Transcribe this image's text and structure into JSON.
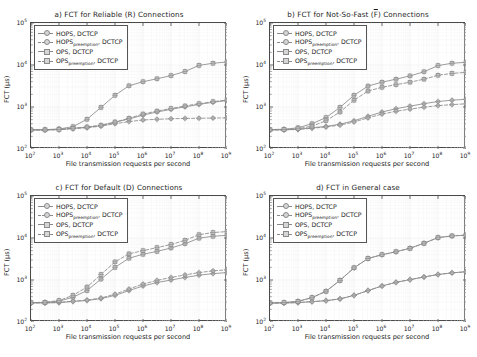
{
  "figure": {
    "background": "#ffffff",
    "line_color": "#8a8a8a",
    "marker_face": "#d6d6d6",
    "axis_color": "#4a4a4a",
    "rows": 2,
    "cols": 2
  },
  "axis": {
    "xlabel": "File transmission requests per second",
    "ylabel": "FCT (µs)",
    "xticks": [
      "10²",
      "10³",
      "10⁴",
      "10⁵",
      "10⁶",
      "10⁷",
      "10⁸",
      "10⁹"
    ],
    "xtick_mantissas": [
      "10",
      "10",
      "10",
      "10",
      "10",
      "10",
      "10",
      "10"
    ],
    "xtick_exponents": [
      "2",
      "3",
      "4",
      "5",
      "6",
      "7",
      "8",
      "9"
    ],
    "yticks": [
      "10²",
      "10³",
      "10⁴",
      "10⁵"
    ],
    "ytick_mantissas": [
      "10",
      "10",
      "10",
      "10"
    ],
    "ytick_exponents": [
      "2",
      "3",
      "4",
      "5"
    ],
    "xlim": [
      100,
      1000000000
    ],
    "ylim": [
      100,
      100000
    ],
    "xscale": "log",
    "yscale": "log",
    "grid": true
  },
  "legend": {
    "position": "upper left",
    "entries": [
      {
        "label": "HOPS, DCTCP",
        "base": "HOPS",
        "sub": "",
        "suffix": ", DCTCP",
        "style": "solid",
        "marker": "plus-circle"
      },
      {
        "label": "HOPS_preemption, DCTCP",
        "base": "HOPS",
        "sub": "preemption",
        "suffix": ", DCTCP",
        "style": "dashed",
        "marker": "plus-circle"
      },
      {
        "label": "OPS, DCTCP",
        "base": "OPS",
        "sub": "",
        "suffix": ", DCTCP",
        "style": "solid",
        "marker": "plus-square"
      },
      {
        "label": "OPS_preemption, DCTCP",
        "base": "OPS",
        "sub": "preemption",
        "suffix": ", DCTCP",
        "style": "dashed",
        "marker": "plus-square"
      }
    ]
  },
  "chart_data": [
    {
      "id": "panel-a",
      "type": "line",
      "title": "a) FCT for Reliable (R) Connections",
      "title_prefix": "a) FCT for Reliable (R) Connections",
      "xlabel": "File transmission requests per second",
      "ylabel": "FCT (µs)",
      "xscale": "log",
      "yscale": "log",
      "xlim": [
        100,
        1000000000
      ],
      "ylim": [
        100,
        100000
      ],
      "x": [
        100,
        316,
        1000,
        3160,
        10000,
        31600,
        100000,
        316000,
        1000000,
        3160000,
        10000000,
        31600000,
        100000000,
        316000000,
        1000000000
      ],
      "series": [
        {
          "name": "HOPS, DCTCP",
          "style": "solid",
          "marker": "circle",
          "values": [
            285,
            285,
            290,
            310,
            330,
            360,
            430,
            520,
            640,
            760,
            880,
            1010,
            1150,
            1300,
            1420
          ]
        },
        {
          "name": "HOPS_preemption, DCTCP",
          "style": "dashed",
          "marker": "circle",
          "values": [
            285,
            285,
            290,
            305,
            320,
            350,
            400,
            450,
            490,
            510,
            525,
            535,
            540,
            545,
            550
          ]
        },
        {
          "name": "OPS, DCTCP",
          "style": "solid",
          "marker": "square",
          "values": [
            285,
            288,
            300,
            340,
            510,
            980,
            1900,
            3200,
            4000,
            4700,
            5600,
            7000,
            9800,
            11000,
            11800
          ]
        },
        {
          "name": "OPS_preemption, DCTCP",
          "style": "dashed",
          "marker": "square",
          "values": [
            285,
            285,
            292,
            312,
            335,
            370,
            440,
            540,
            680,
            800,
            920,
            1060,
            1200,
            1340,
            1470
          ]
        }
      ]
    },
    {
      "id": "panel-b",
      "type": "line",
      "title": "b) FCT for Not-So-Fast (F̄) Connections",
      "title_parts": {
        "before": "b) FCT for Not-So-Fast (",
        "overline": "F",
        "after": ") Connections"
      },
      "xlabel": "File transmission requests per second",
      "ylabel": "FCT (µs)",
      "xscale": "log",
      "yscale": "log",
      "xlim": [
        100,
        1000000000
      ],
      "ylim": [
        100,
        100000
      ],
      "x": [
        100,
        316,
        1000,
        3160,
        10000,
        31600,
        100000,
        316000,
        1000000,
        3160000,
        10000000,
        31600000,
        100000000,
        316000000,
        1000000000
      ],
      "series": [
        {
          "name": "HOPS, DCTCP",
          "style": "solid",
          "marker": "circle",
          "values": [
            285,
            287,
            295,
            320,
            345,
            390,
            470,
            600,
            760,
            910,
            1050,
            1200,
            1350,
            1450,
            1530
          ]
        },
        {
          "name": "HOPS_preemption, DCTCP",
          "style": "dashed",
          "marker": "circle",
          "values": [
            285,
            286,
            292,
            312,
            335,
            370,
            440,
            550,
            680,
            790,
            890,
            990,
            1080,
            1140,
            1190
          ]
        },
        {
          "name": "OPS, DCTCP",
          "style": "solid",
          "marker": "square",
          "values": [
            290,
            295,
            320,
            400,
            560,
            980,
            1900,
            3150,
            3900,
            4600,
            5500,
            6900,
            9700,
            11000,
            11600
          ]
        },
        {
          "name": "OPS_preemption, DCTCP",
          "style": "dashed",
          "marker": "square",
          "values": [
            285,
            290,
            305,
            350,
            470,
            760,
            1450,
            2400,
            2950,
            3400,
            3900,
            4600,
            5700,
            6300,
            6700
          ]
        }
      ]
    },
    {
      "id": "panel-c",
      "type": "line",
      "title": "c) FCT for Default (D) Connections",
      "title_prefix": "c) FCT for Default (D) Connections",
      "xlabel": "File transmission requests per second",
      "ylabel": "FCT (µs)",
      "xscale": "log",
      "yscale": "log",
      "xlim": [
        100,
        1000000000
      ],
      "ylim": [
        100,
        100000
      ],
      "x": [
        100,
        316,
        1000,
        3160,
        10000,
        31600,
        100000,
        316000,
        1000000,
        3160000,
        10000000,
        31600000,
        100000000,
        316000000,
        1000000000
      ],
      "series": [
        {
          "name": "HOPS, DCTCP",
          "style": "solid",
          "marker": "circle",
          "values": [
            285,
            285,
            290,
            308,
            325,
            360,
            430,
            560,
            720,
            870,
            1000,
            1150,
            1300,
            1420,
            1500
          ]
        },
        {
          "name": "HOPS_preemption, DCTCP",
          "style": "dashed",
          "marker": "circle",
          "values": [
            285,
            286,
            292,
            312,
            333,
            372,
            460,
            610,
            800,
            980,
            1150,
            1320,
            1500,
            1650,
            1750
          ]
        },
        {
          "name": "OPS, DCTCP",
          "style": "solid",
          "marker": "square",
          "values": [
            288,
            292,
            312,
            390,
            560,
            1050,
            2000,
            3300,
            4100,
            4800,
            5800,
            7300,
            9900,
            11000,
            11600
          ]
        },
        {
          "name": "OPS_preemption, DCTCP",
          "style": "dashed",
          "marker": "square",
          "values": [
            288,
            295,
            325,
            430,
            680,
            1350,
            2700,
            4200,
            5000,
            5900,
            7000,
            8800,
            12000,
            13500,
            14200
          ]
        }
      ]
    },
    {
      "id": "panel-d",
      "type": "line",
      "title": "d) FCT in General case",
      "title_prefix": "d) FCT in General case",
      "xlabel": "File transmission requests per second",
      "ylabel": "FCT (µs)",
      "xscale": "log",
      "yscale": "log",
      "xlim": [
        100,
        1000000000
      ],
      "ylim": [
        100,
        100000
      ],
      "x": [
        100,
        316,
        1000,
        3160,
        10000,
        31600,
        100000,
        316000,
        1000000,
        3160000,
        10000000,
        31600000,
        100000000,
        316000000,
        1000000000
      ],
      "series": [
        {
          "name": "HOPS, DCTCP",
          "style": "solid",
          "marker": "circle",
          "values": [
            282,
            284,
            290,
            305,
            322,
            355,
            430,
            560,
            720,
            880,
            1020,
            1180,
            1350,
            1480,
            1570
          ]
        },
        {
          "name": "HOPS_preemption, DCTCP",
          "style": "dashed",
          "marker": "circle",
          "values": [
            282,
            284,
            290,
            305,
            322,
            355,
            430,
            560,
            720,
            880,
            1020,
            1180,
            1350,
            1480,
            1570
          ]
        },
        {
          "name": "OPS, DCTCP",
          "style": "solid",
          "marker": "square",
          "values": [
            285,
            290,
            310,
            380,
            540,
            980,
            1950,
            3250,
            4000,
            4700,
            5700,
            7500,
            10200,
            11200,
            11700
          ]
        },
        {
          "name": "OPS_preemption, DCTCP",
          "style": "dashed",
          "marker": "square",
          "values": [
            285,
            290,
            310,
            380,
            540,
            980,
            1950,
            3250,
            4000,
            4700,
            5700,
            7500,
            10200,
            11200,
            11700
          ]
        }
      ]
    }
  ]
}
